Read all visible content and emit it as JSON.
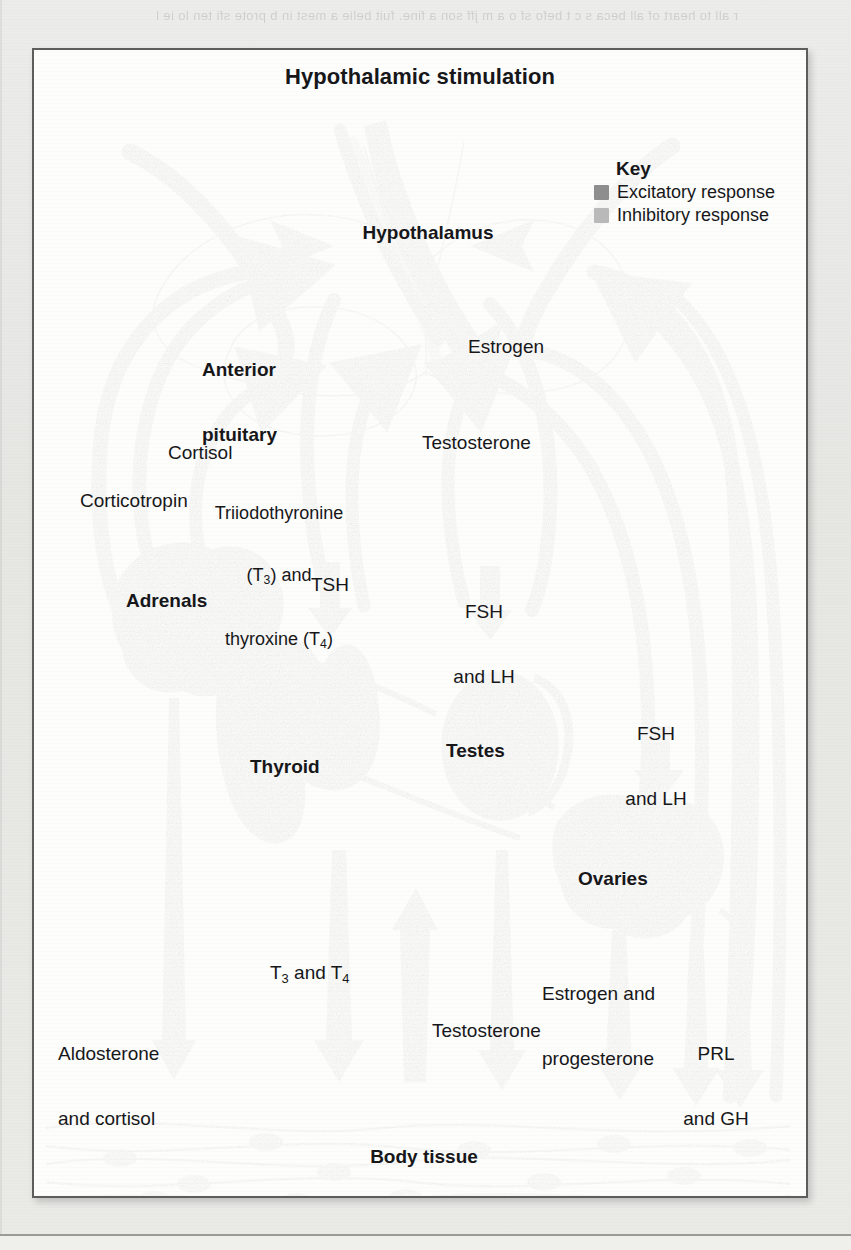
{
  "page": {
    "bleed_text": "r all to heart of all beca s c t befo sf o a m jff  son a\nfine.  fuit belie a  mest  in b  prote  sfi  ten  lo ie l"
  },
  "diagram": {
    "title": "Hypothalamic stimulation",
    "key": {
      "title": "Key",
      "items": [
        {
          "label": "Excitatory response",
          "color": "#8e8e8e"
        },
        {
          "label": "Inhibitory response",
          "color": "#b9b9b9"
        }
      ]
    },
    "organs": [
      {
        "id": "hypothalamus",
        "label": "Hypothalamus"
      },
      {
        "id": "anterior-pituitary",
        "label": "Anterior\npituitary"
      },
      {
        "id": "adrenals",
        "label": "Adrenals"
      },
      {
        "id": "thyroid",
        "label": "Thyroid"
      },
      {
        "id": "testes",
        "label": "Testes"
      },
      {
        "id": "ovaries",
        "label": "Ovaries"
      },
      {
        "id": "body-tissue",
        "label": "Body tissue"
      }
    ],
    "feedback_labels": [
      {
        "id": "cortisol",
        "label": "Cortisol"
      },
      {
        "id": "corticotropin",
        "label": "Corticotropin"
      },
      {
        "id": "t3-t4",
        "label": "Triiodothyronine (T3) and thyroxine (T4)"
      },
      {
        "id": "testosterone-fb",
        "label": "Testosterone"
      },
      {
        "id": "estrogen-fb",
        "label": "Estrogen"
      }
    ],
    "tropic_labels": [
      {
        "id": "tsh",
        "label": "TSH"
      },
      {
        "id": "fsh-lh-testes",
        "label": "FSH\nand LH"
      },
      {
        "id": "fsh-lh-ovaries",
        "label": "FSH\nand LH"
      }
    ],
    "effector_labels": [
      {
        "id": "aldosterone-cortisol",
        "label": "Aldosterone\nand cortisol"
      },
      {
        "id": "t3-and-t4",
        "label": "T3 and T4"
      },
      {
        "id": "testosterone-out",
        "label": "Testosterone"
      },
      {
        "id": "estrogen-progesterone",
        "label": "Estrogen and\nprogesterone"
      },
      {
        "id": "prl-gh",
        "label": "PRL\nand GH"
      }
    ],
    "colors": {
      "excitatory": "#8e8e8e",
      "inhibitory": "#b9b9b9",
      "text": "#17171a",
      "frame": "#5d5d5d",
      "paper": "#fdfdfc"
    }
  }
}
